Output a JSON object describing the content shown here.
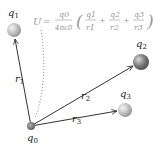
{
  "diagram": {
    "equation": {
      "lhs": "U",
      "equals": "=",
      "prefactor_num": "q0",
      "prefactor_den": "4πε0",
      "terms": [
        {
          "num": "q1",
          "den": "r1"
        },
        {
          "num": "q2",
          "den": "r2"
        },
        {
          "num": "q3",
          "den": "r3"
        }
      ],
      "plus": "+",
      "open_paren": "(",
      "close_paren": ")",
      "color": "#999999"
    },
    "charges": [
      {
        "id": "q0",
        "label": "q",
        "sub": "0",
        "x": 31,
        "y": 126,
        "r": 4,
        "color": "#777777"
      },
      {
        "id": "q1",
        "label": "q",
        "sub": "1",
        "x": 14,
        "y": 30,
        "r": 7,
        "color": "#bbbbbb"
      },
      {
        "id": "q2",
        "label": "q",
        "sub": "2",
        "x": 141,
        "y": 62,
        "r": 8,
        "color": "#8a8a8a"
      },
      {
        "id": "q3",
        "label": "q",
        "sub": "3",
        "x": 125,
        "y": 110,
        "r": 7,
        "color": "#c8c8c8"
      }
    ],
    "vectors": [
      {
        "id": "r1",
        "label": "r",
        "sub": "1",
        "from": "q0",
        "to": "q1"
      },
      {
        "id": "r2",
        "label": "r",
        "sub": "2",
        "from": "q0",
        "to": "q2"
      },
      {
        "id": "r3",
        "label": "r",
        "sub": "3",
        "from": "q0",
        "to": "q3"
      }
    ],
    "line_color": "#333333",
    "dotted_color": "#999999"
  }
}
